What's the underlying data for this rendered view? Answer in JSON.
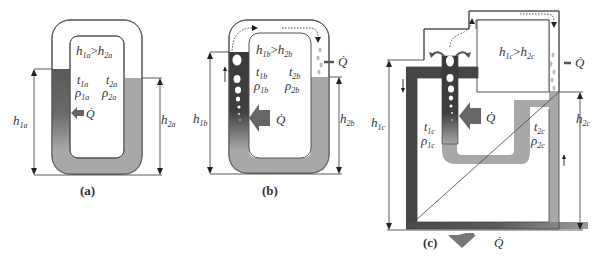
{
  "figure": {
    "panels": [
      {
        "id": "a",
        "caption": "(a)",
        "inequality": {
          "left": "h",
          "left_sub": "1a",
          "op": ">",
          "right": "h",
          "right_sub": "2a"
        },
        "left_column": {
          "t": "t",
          "t_sub": "1a",
          "rho": "ρ",
          "rho_sub": "1a"
        },
        "right_column": {
          "t": "t",
          "t_sub": "2a",
          "rho": "ρ",
          "rho_sub": "2a"
        },
        "heat_input": "Q̇",
        "height_left": {
          "h": "h",
          "sub": "1a"
        },
        "height_right": {
          "h": "h",
          "sub": "2a"
        }
      },
      {
        "id": "b",
        "caption": "(b)",
        "inequality": {
          "left": "h",
          "left_sub": "1b",
          "op": ">",
          "right": "h",
          "right_sub": "2b"
        },
        "left_column": {
          "t": "t",
          "t_sub": "1b",
          "rho": "ρ",
          "rho_sub": "1b"
        },
        "right_column": {
          "t": "t",
          "t_sub": "2b",
          "rho": "ρ",
          "rho_sub": "2b"
        },
        "heat_input": "Q̇",
        "heat_output": "Q̇",
        "height_left": {
          "h": "h",
          "sub": "1b"
        },
        "height_right": {
          "h": "h",
          "sub": "2b"
        }
      },
      {
        "id": "c",
        "caption": "(c)",
        "inequality": {
          "left": "h",
          "left_sub": "1c",
          "op": ">",
          "right": "h",
          "right_sub": "2c"
        },
        "left_column": {
          "t": "t",
          "t_sub": "1c",
          "rho": "ρ",
          "rho_sub": "1c"
        },
        "right_column": {
          "t": "t",
          "t_sub": "2c",
          "rho": "ρ",
          "rho_sub": "2c"
        },
        "heat_input": "Q̇",
        "heat_output_right": "Q̇",
        "heat_output_bottom": "Q̇",
        "height_left": {
          "h": "h",
          "sub": "1c"
        },
        "height_right": {
          "h": "h",
          "sub": "2c"
        }
      }
    ],
    "colors": {
      "hot_fluid": "#4a4a4a",
      "cold_fluid": "#a8a8a8",
      "pipe_outline": "#555555",
      "arrow": "#666666",
      "dim_line": "#333333"
    }
  }
}
